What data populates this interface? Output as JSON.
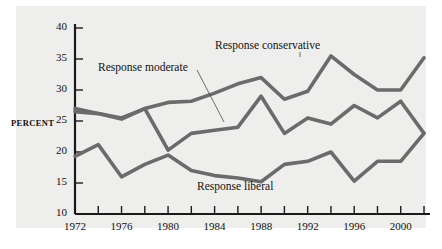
{
  "axis": {
    "ylabel": "PERCENT",
    "yticks": [
      "40",
      "35",
      "30",
      "25",
      "20",
      "15",
      "10"
    ],
    "xticks_labeled": [
      "1972",
      "1976",
      "1980",
      "1984",
      "1988",
      "1992",
      "1996",
      "2000"
    ]
  },
  "labels": {
    "conservative": "Response conservative",
    "moderate": "Response moderate",
    "liberal": "Response liberal"
  },
  "colors": {
    "line": "#6b6b6b",
    "axis": "#1a1a1a",
    "plot_background": "#eeeeec",
    "page_background": "#ffffff"
  },
  "chart_data": {
    "type": "line",
    "title": "",
    "xlabel": "",
    "ylabel": "PERCENT",
    "xlim": [
      1972,
      2002
    ],
    "ylim": [
      10,
      40
    ],
    "grid": false,
    "legend": "inline-annotations",
    "x": [
      1972,
      1974,
      1976,
      1978,
      1980,
      1982,
      1984,
      1986,
      1988,
      1990,
      1992,
      1994,
      1996,
      1998,
      2000,
      2002
    ],
    "series": [
      {
        "name": "Response conservative",
        "values": [
          27.0,
          26.2,
          25.5,
          27.0,
          28.0,
          28.2,
          29.5,
          31.0,
          32.0,
          28.5,
          29.8,
          35.5,
          32.5,
          30.0,
          30.0,
          35.2
        ]
      },
      {
        "name": "Response moderate",
        "values": [
          26.5,
          26.2,
          25.3,
          27.0,
          20.3,
          23.0,
          23.5,
          24.0,
          29.0,
          23.0,
          25.5,
          24.5,
          27.5,
          25.5,
          28.2,
          23.0
        ]
      },
      {
        "name": "Response liberal",
        "values": [
          19.3,
          21.2,
          16.0,
          18.0,
          19.5,
          17.0,
          16.2,
          15.8,
          15.2,
          18.0,
          18.5,
          20.0,
          15.3,
          18.5,
          18.5,
          23.0
        ]
      }
    ]
  }
}
